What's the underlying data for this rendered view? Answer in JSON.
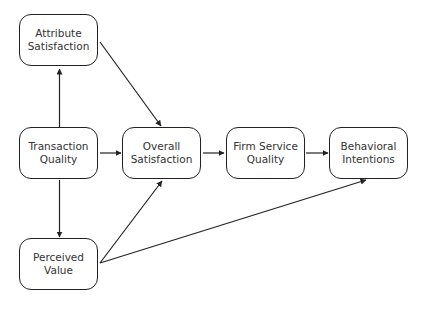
{
  "nodes": {
    "attribute_satisfaction": {
      "line1": "Attribute",
      "line2": "Satisfaction"
    },
    "transaction_quality": {
      "line1": "Transaction",
      "line2": "Quality"
    },
    "overall_satisfaction": {
      "line1": "Overall",
      "line2": "Satisfaction"
    },
    "firm_service_quality": {
      "line1": "Firm Service",
      "line2": "Quality"
    },
    "behavioral_intentions": {
      "line1": "Behavioral",
      "line2": "Intentions"
    },
    "perceived_value": {
      "line1": "Perceived",
      "line2": "Value"
    }
  },
  "edges": [
    {
      "from": "Transaction Quality",
      "to": "Attribute Satisfaction"
    },
    {
      "from": "Transaction Quality",
      "to": "Overall Satisfaction"
    },
    {
      "from": "Transaction Quality",
      "to": "Perceived Value"
    },
    {
      "from": "Attribute Satisfaction",
      "to": "Overall Satisfaction"
    },
    {
      "from": "Perceived Value",
      "to": "Overall Satisfaction"
    },
    {
      "from": "Perceived Value",
      "to": "Behavioral Intentions"
    },
    {
      "from": "Overall Satisfaction",
      "to": "Firm Service Quality"
    },
    {
      "from": "Firm Service Quality",
      "to": "Behavioral Intentions"
    }
  ]
}
